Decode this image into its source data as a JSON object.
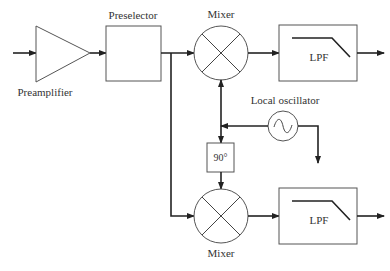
{
  "diagram": {
    "blocks": {
      "preamplifier": {
        "label": "Preamplifier",
        "shape": "triangle"
      },
      "preselector": {
        "label": "Preselector",
        "shape": "box"
      },
      "mixer_top": {
        "label": "Mixer",
        "shape": "circle-x"
      },
      "mixer_bottom": {
        "label": "Mixer",
        "shape": "circle-x"
      },
      "lpf_top": {
        "label": "LPF",
        "shape": "box-lowpass"
      },
      "lpf_bottom": {
        "label": "LPF",
        "shape": "box-lowpass"
      },
      "local_oscillator": {
        "label": "Local oscillator",
        "shape": "circle-sine"
      },
      "phase_shifter": {
        "label": "90°",
        "shape": "box"
      }
    },
    "connections": [
      {
        "from": "input",
        "to": "preamplifier"
      },
      {
        "from": "preamplifier",
        "to": "preselector"
      },
      {
        "from": "preselector",
        "to": "mixer_top"
      },
      {
        "from": "preselector",
        "to": "mixer_bottom"
      },
      {
        "from": "local_oscillator",
        "to": "mixer_top"
      },
      {
        "from": "local_oscillator",
        "to": "phase_shifter"
      },
      {
        "from": "phase_shifter",
        "to": "mixer_bottom"
      },
      {
        "from": "local_oscillator",
        "to": "output-aux"
      },
      {
        "from": "mixer_top",
        "to": "lpf_top"
      },
      {
        "from": "mixer_bottom",
        "to": "lpf_bottom"
      },
      {
        "from": "lpf_top",
        "to": "output-i"
      },
      {
        "from": "lpf_bottom",
        "to": "output-q"
      }
    ]
  }
}
